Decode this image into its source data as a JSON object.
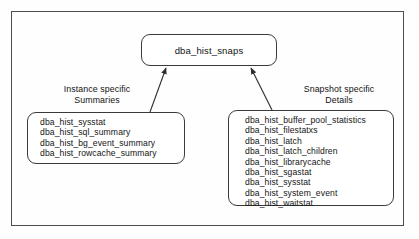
{
  "diagram": {
    "root": {
      "label": "dba_hist_snaps"
    },
    "left_group": {
      "heading_line1": "Instance specific",
      "heading_line2": "Summaries",
      "items": [
        "dba_hist_sysstat",
        "dba_hist_sql_summary",
        "dba_hist_bg_event_summary",
        "dba_hist_rowcache_summary"
      ]
    },
    "right_group": {
      "heading_line1": "Snapshot specific",
      "heading_line2": "Details",
      "items": [
        "dba_hist_buffer_pool_statistics",
        "dba_hist_filestatxs",
        "dba_hist_latch",
        "dba_hist_latch_children",
        "dba_hist_librarycache",
        "dba_hist_sgastat",
        "dba_hist_sysstat",
        "dba_hist_system_event",
        "dba_hist_waitstat"
      ]
    },
    "colors": {
      "stroke": "#3a3a3a",
      "frame": "#4d4d4d",
      "text": "#141414",
      "background": "#ffffff"
    }
  }
}
